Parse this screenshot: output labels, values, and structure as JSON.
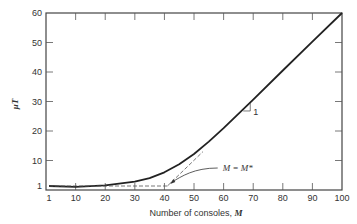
{
  "chart_data": {
    "type": "line",
    "title": "",
    "xlabel": "Number of consoles, M",
    "xlabel_text": "Number of consoles, ",
    "xlabel_var": "M",
    "ylabel": "μT",
    "xlim": [
      1,
      100
    ],
    "ylim": [
      0,
      60
    ],
    "grid": false,
    "legend": null,
    "x_ticks": [
      1,
      10,
      20,
      30,
      40,
      50,
      60,
      70,
      80,
      90,
      100
    ],
    "y_ticks": [
      1,
      10,
      20,
      30,
      40,
      50,
      60
    ],
    "series": [
      {
        "name": "μT (response curve)",
        "style": "solid",
        "x": [
          1,
          10,
          20,
          30,
          35,
          40,
          45,
          50,
          55,
          60,
          70,
          80,
          90,
          100
        ],
        "y": [
          1,
          1.1,
          1.6,
          2.8,
          4.0,
          6.0,
          8.7,
          12.2,
          16.4,
          21.0,
          30.6,
          40.5,
          50.3,
          60
        ]
      },
      {
        "name": "asymptote (slope 1)",
        "style": "dashed",
        "x": [
          41,
          53
        ],
        "y": [
          1,
          13
        ]
      },
      {
        "name": "lower bound μT = 1",
        "style": "dashed",
        "x": [
          1,
          41
        ],
        "y": [
          1,
          1
        ]
      }
    ],
    "annotations": [
      {
        "text": "M = M*",
        "points_to": {
          "x": 41,
          "y": 1
        }
      },
      {
        "text": "1",
        "description": "slope triangle marker near M=70"
      }
    ]
  }
}
